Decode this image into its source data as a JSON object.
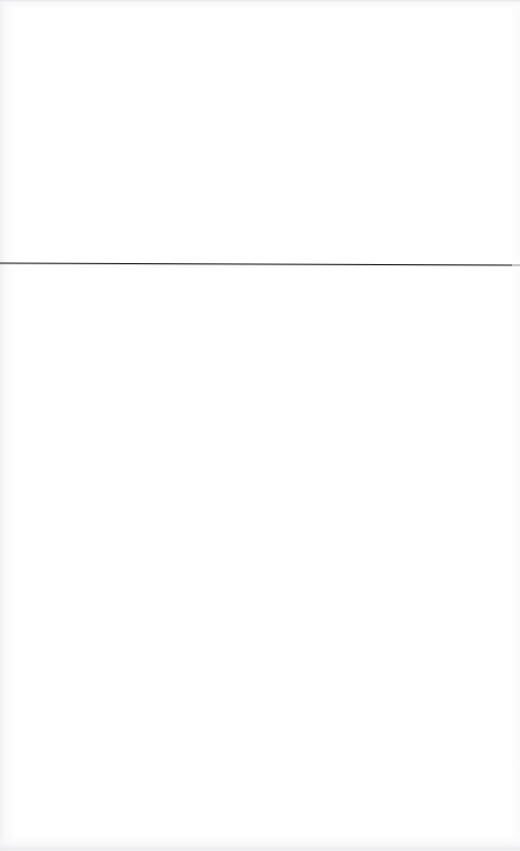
{
  "document": {
    "kind": "scanned-page",
    "page_background": "#ffffff",
    "width_px": 520,
    "height_px": 851,
    "visible_text": "",
    "note": ""
  },
  "rule": {
    "name": "horizontal-rule",
    "color": "#272727",
    "color_soft": "#8b8b90",
    "thickness_px": 1,
    "x_start_px": 0,
    "x_end_px": 520,
    "y_left_px": 263,
    "y_right_px": 265,
    "spans_full_width": true
  },
  "artifacts": {
    "top_edge_color": "#e4e4e7",
    "bottom_edge_color": "#ebebee",
    "left_streak_color": "#efeff2",
    "paper_tint": "#f6f6f8"
  }
}
